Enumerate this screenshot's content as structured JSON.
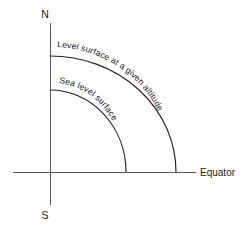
{
  "figure": {
    "type": "geodesy-quadrant-diagram",
    "background_color": "#ffffff",
    "line_color": "#222222",
    "axis_color": "#5a5a5a",
    "text_color": "#1a1a1a",
    "width": 250,
    "height": 231
  },
  "axes": {
    "origin": {
      "x": 50,
      "y": 172
    },
    "vertical": {
      "name": "polar-axis",
      "x": 50,
      "y_top": 23,
      "y_bottom": 205
    },
    "horizontal": {
      "name": "equatorial-axis",
      "y": 172,
      "x_left": 13,
      "x_right": 196
    }
  },
  "labels": {
    "north": "N",
    "south": "S",
    "equator": "Equator"
  },
  "curves": [
    {
      "id": "level-surface",
      "label": "Level surface at a given altitude",
      "rx": 126,
      "ry": 116,
      "axis_intercept_y": 56,
      "equator_intercept_x": 176
    },
    {
      "id": "sea-level-surface",
      "label": "Sea level surface",
      "rx": 76,
      "ry": 82,
      "axis_intercept_y": 90,
      "equator_intercept_x": 126
    }
  ]
}
